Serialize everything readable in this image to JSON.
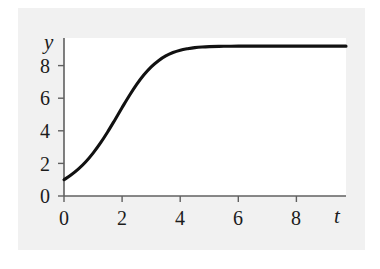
{
  "figure": {
    "background_color": "#ffffff",
    "panel_color": "#f1f1f1",
    "plot_background_color": "#ffffff",
    "axis_color": "#555555",
    "curve_color": "#111111"
  },
  "chart_data": {
    "type": "line",
    "title": "",
    "xlabel": "t",
    "ylabel": "y",
    "xlim": [
      0,
      9.7
    ],
    "ylim": [
      0,
      9.7
    ],
    "xticks": [
      0,
      2,
      4,
      6,
      8
    ],
    "yticks": [
      0,
      2,
      4,
      6,
      8
    ],
    "xtick_labels": [
      "0",
      "2",
      "4",
      "6",
      "8"
    ],
    "ytick_labels": [
      "0",
      "2",
      "4",
      "6",
      "8"
    ],
    "grid": false,
    "legend": null,
    "annotations": [],
    "series": [
      {
        "name": "logistic growth",
        "equation": "y = 9.2 / (1 + 8.2 e^(-1.15 t))",
        "x": [
          0,
          0.25,
          0.5,
          0.75,
          1,
          1.25,
          1.5,
          1.75,
          2,
          2.25,
          2.5,
          2.75,
          3,
          3.25,
          3.5,
          3.75,
          4,
          4.25,
          4.5,
          4.75,
          5,
          5.5,
          6,
          6.5,
          7,
          7.5,
          8,
          8.5,
          9,
          9.7
        ],
        "y": [
          1.0,
          1.3,
          1.66,
          2.1,
          2.63,
          3.24,
          3.93,
          4.67,
          5.43,
          6.17,
          6.85,
          7.44,
          7.93,
          8.31,
          8.6,
          8.81,
          8.95,
          9.04,
          9.11,
          9.15,
          9.17,
          9.19,
          9.2,
          9.2,
          9.2,
          9.2,
          9.2,
          9.2,
          9.2,
          9.2
        ]
      }
    ]
  },
  "labels": {
    "y_axis_name": "y",
    "x_axis_name": "t",
    "y_ticks": [
      "8",
      "6",
      "4",
      "2",
      "0"
    ],
    "x_ticks": [
      "0",
      "2",
      "4",
      "6",
      "8"
    ]
  }
}
